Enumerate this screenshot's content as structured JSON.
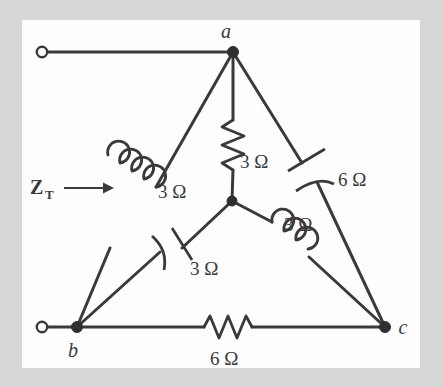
{
  "figure": {
    "background_color": "#d7d7d7",
    "panel_color": "#fdfdfd",
    "line_color": "#3a3a3c"
  },
  "nodes": [
    {
      "id": "a",
      "label": "a",
      "x": 233,
      "y": 52
    },
    {
      "id": "b",
      "label": "b",
      "x": 77,
      "y": 327
    },
    {
      "id": "c",
      "label": "c",
      "x": 385,
      "y": 327
    },
    {
      "id": "n",
      "label": "",
      "x": 232,
      "y": 201
    }
  ],
  "terminals": [
    {
      "id": "top-terminal",
      "x": 42,
      "y": 52
    },
    {
      "id": "bottom-terminal",
      "x": 42,
      "y": 327
    }
  ],
  "components": [
    {
      "id": "r-center-a",
      "type": "resistor",
      "label": "3 Ω",
      "between": "a-n",
      "label_x": 240,
      "label_y": 168
    },
    {
      "id": "l-a-b",
      "type": "inductor",
      "label": "3 Ω",
      "between": "a-b",
      "label_x": 158,
      "label_y": 198
    },
    {
      "id": "c-a-c",
      "type": "capacitor",
      "label": "6 Ω",
      "between": "a-c",
      "label_x": 338,
      "label_y": 186
    },
    {
      "id": "l-n-c",
      "type": "inductor",
      "label": "3 Ω",
      "between": "n-c",
      "label_x": 284,
      "label_y": 231
    },
    {
      "id": "c-n-b",
      "type": "capacitor",
      "label": "3 Ω",
      "between": "n-b",
      "label_x": 190,
      "label_y": 275
    },
    {
      "id": "r-b-c",
      "type": "resistor",
      "label": "6 Ω",
      "between": "b-c",
      "label_x": 210,
      "label_y": 365
    }
  ],
  "annotations": {
    "impedance_label": "Z",
    "impedance_subscript": "T",
    "impedance_label_x": 30,
    "impedance_label_y": 194,
    "arrow_x1": 64,
    "arrow_x2": 108,
    "arrow_y": 188
  }
}
